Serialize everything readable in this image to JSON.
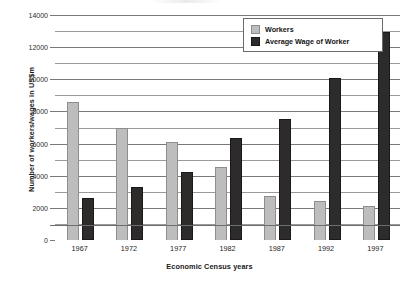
{
  "chart_data": {
    "type": "bar",
    "title": "",
    "xlabel": "Economic Census years",
    "ylabel": "Number of workers/wages in US$m",
    "categories": [
      "1967",
      "1972",
      "1977",
      "1982",
      "1987",
      "1992",
      "1997"
    ],
    "series": [
      {
        "name": "Workers",
        "color": "#bdbdbd",
        "values": [
          8500,
          6900,
          6050,
          4450,
          2700,
          2350,
          2050
        ]
      },
      {
        "name": "Average Wage of Worker",
        "color": "#2e2b2b",
        "values": [
          2500,
          3200,
          4100,
          6200,
          7400,
          9950,
          12800
        ]
      }
    ],
    "ylim": [
      0,
      14000
    ],
    "ytick_labels": [
      "0",
      "2000",
      "4000",
      "6000",
      "8000",
      "10000",
      "12000",
      "14000"
    ],
    "ytick_values": [
      0,
      2000,
      4000,
      6000,
      8000,
      10000,
      12000,
      14000
    ],
    "minor_gridline_values": [
      1000,
      3000,
      5000,
      7000,
      9000,
      11000,
      13000
    ],
    "grid": true,
    "legend_position": "top-right"
  },
  "legend": {
    "items": [
      {
        "label": "Workers",
        "swatch": "workers"
      },
      {
        "label": "Average Wage of Worker",
        "swatch": "wage"
      }
    ]
  }
}
